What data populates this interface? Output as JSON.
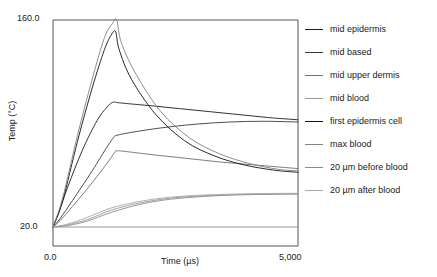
{
  "chart_data": {
    "type": "line",
    "title": "",
    "xlabel": "Time (µs)",
    "ylabel": "Temp (°C)",
    "xlim": [
      0,
      5000
    ],
    "ylim": [
      20.0,
      160.0
    ],
    "xticks": [
      "0.0",
      "5,000"
    ],
    "yticks": [
      "20.0",
      "160.0"
    ],
    "xtick_values": [
      0,
      5000
    ],
    "ytick_values": [
      20.0,
      160.0
    ],
    "grid": false,
    "legend_position": "right",
    "series": [
      {
        "name": "mid epidermis",
        "color": "#1c1c1c",
        "x": [
          0,
          120,
          300,
          600,
          900,
          1100,
          1200,
          1250,
          1300,
          1500,
          2000,
          2600,
          3200,
          3800,
          4400,
          5000
        ],
        "values": [
          20.0,
          30.0,
          47.0,
          72.0,
          92.0,
          101.0,
          104.0,
          104.5,
          104.2,
          103.5,
          102.0,
          100.0,
          98.0,
          96.0,
          94.0,
          92.5
        ]
      },
      {
        "name": "mid based",
        "color": "#3a3a3a",
        "x": [
          0,
          150,
          400,
          800,
          1100,
          1250,
          1300,
          1600,
          2200,
          2900,
          3600,
          4300,
          5000
        ],
        "values": [
          20.0,
          26.0,
          38.0,
          58.0,
          74.0,
          81.0,
          82.0,
          84.0,
          87.0,
          89.5,
          91.0,
          91.5,
          91.0
        ]
      },
      {
        "name": "mid upper dermis",
        "color": "#6e6e6e",
        "x": [
          0,
          150,
          400,
          800,
          1100,
          1250,
          1300,
          1500,
          2000,
          2700,
          3400,
          4100,
          5000
        ],
        "values": [
          20.0,
          24.5,
          34.0,
          50.0,
          63.0,
          70.0,
          71.5,
          71.0,
          69.0,
          66.5,
          64.0,
          62.0,
          59.5
        ]
      },
      {
        "name": "mid blood",
        "color": "#9a9a9a",
        "x": [
          0,
          300,
          700,
          1200,
          1800,
          2400,
          3000,
          3600,
          4200,
          5000
        ],
        "values": [
          20.0,
          21.5,
          25.0,
          31.5,
          36.5,
          39.5,
          41.0,
          41.8,
          42.2,
          42.5
        ]
      },
      {
        "name": "first epidermis cell",
        "color": "#121212",
        "x": [
          0,
          200,
          500,
          800,
          1050,
          1200,
          1280,
          1350,
          1600,
          2100,
          2700,
          3300,
          3900,
          4500,
          5000
        ],
        "values": [
          20.0,
          38.0,
          78.0,
          114.0,
          140.0,
          150.5,
          152.0,
          140.0,
          120.0,
          96.0,
          78.0,
          68.0,
          62.0,
          58.5,
          57.0
        ]
      },
      {
        "name": "max blood",
        "color": "#818181",
        "x": [
          0,
          200,
          500,
          800,
          1050,
          1220,
          1300,
          1400,
          1700,
          2200,
          2800,
          3400,
          4000,
          4600,
          5000
        ],
        "values": [
          20.0,
          40.0,
          82.0,
          120.0,
          148.0,
          158.0,
          160.0,
          144.0,
          123.0,
          98.0,
          80.0,
          69.5,
          63.0,
          59.0,
          58.0
        ]
      },
      {
        "name": "20 µm before blood",
        "color": "#8c8c8c",
        "x": [
          0,
          300,
          700,
          1200,
          1800,
          2400,
          3000,
          3600,
          4200,
          5000
        ],
        "values": [
          20.0,
          21.0,
          24.0,
          30.0,
          35.5,
          38.8,
          40.5,
          41.5,
          42.0,
          42.3
        ]
      },
      {
        "name": "20 µm after blood",
        "color": "#a8a8a8",
        "x": [
          0,
          300,
          700,
          1200,
          1800,
          2400,
          3000,
          3600,
          4200,
          5000
        ],
        "values": [
          20.0,
          22.0,
          26.5,
          33.0,
          37.5,
          40.2,
          41.5,
          42.2,
          42.6,
          42.8
        ]
      }
    ]
  },
  "axes": {
    "ytick_top": "160.0",
    "ytick_bottom": "20.0",
    "xtick_left": "0.0",
    "xtick_right": "5,000",
    "xlabel": "Time (µs)",
    "ylabel": "Temp (°C)"
  },
  "legend": {
    "items": [
      {
        "label": "mid epidermis",
        "color": "#1c1c1c"
      },
      {
        "label": "mid based",
        "color": "#3a3a3a"
      },
      {
        "label": "mid upper dermis",
        "color": "#6e6e6e"
      },
      {
        "label": "mid blood",
        "color": "#9a9a9a"
      },
      {
        "label": "first epidermis cell",
        "color": "#121212"
      },
      {
        "label": "max blood",
        "color": "#818181"
      },
      {
        "label": "20 µm before blood",
        "color": "#8c8c8c"
      },
      {
        "label": "20 µm after blood",
        "color": "#a8a8a8"
      }
    ]
  },
  "style": {
    "frame_color": "#555555",
    "background": "#ffffff"
  }
}
